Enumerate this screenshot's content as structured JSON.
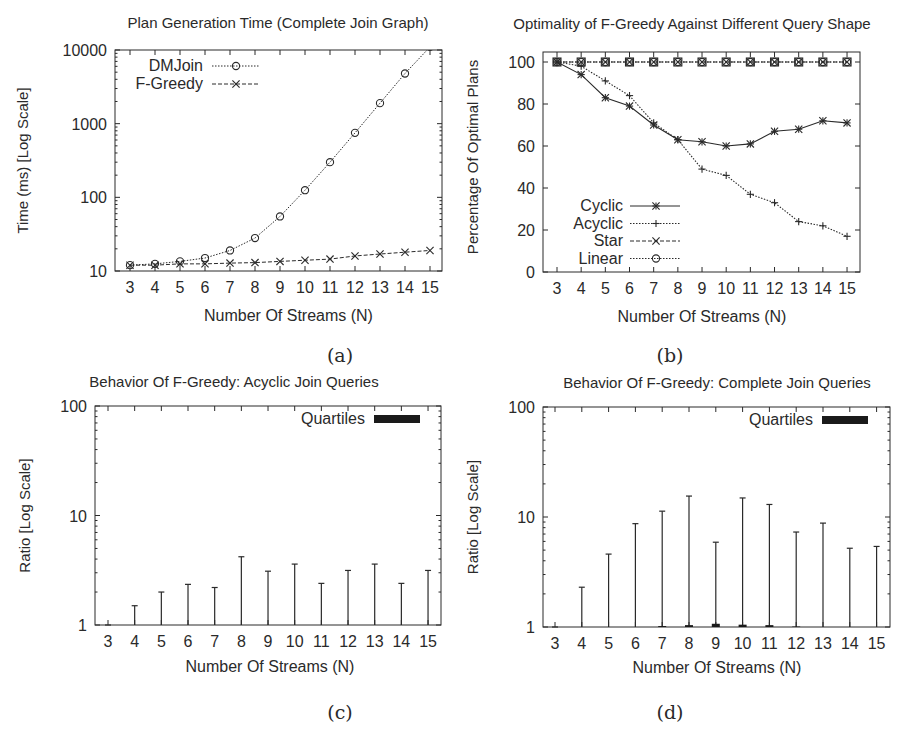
{
  "chart_data": [
    {
      "id": "a",
      "type": "line",
      "caption": "(a)",
      "title": "Plan Generation Time (Complete Join Graph)",
      "xlabel": "Number Of Streams (N)",
      "ylabel": "Time (ms) [Log Scale]",
      "yscale": "log",
      "ylim": [
        10,
        10000
      ],
      "yticks": [
        "10",
        "100",
        "1000",
        "10000"
      ],
      "x": [
        3,
        4,
        5,
        6,
        7,
        8,
        9,
        10,
        11,
        12,
        13,
        14,
        15
      ],
      "legend_position": "top-left",
      "grid": false,
      "series": [
        {
          "name": "DMJoin",
          "marker": "circle",
          "dash": "dotted",
          "values": [
            12,
            12.5,
            13.5,
            15,
            19,
            28,
            55,
            125,
            300,
            750,
            1900,
            4800,
            11000
          ]
        },
        {
          "name": "F-Greedy",
          "marker": "x",
          "dash": "dashed",
          "values": [
            12,
            12,
            12.5,
            12.5,
            12.8,
            13,
            13.5,
            14,
            14.5,
            16,
            17,
            18,
            19
          ]
        }
      ]
    },
    {
      "id": "b",
      "type": "line",
      "caption": "(b)",
      "title": "Optimality of F-Greedy Against Different Query Shape",
      "xlabel": "Number Of Streams (N)",
      "ylabel": "Percentage Of Optimal Plans",
      "ylim": [
        0,
        100
      ],
      "yticks": [
        "0",
        "20",
        "40",
        "60",
        "80",
        "100"
      ],
      "x": [
        3,
        4,
        5,
        6,
        7,
        8,
        9,
        10,
        11,
        12,
        13,
        14,
        15
      ],
      "legend_position": "bottom-left",
      "grid": false,
      "series": [
        {
          "name": "Cyclic",
          "marker": "asterisk",
          "dash": "solid",
          "values": [
            100,
            94,
            83,
            79,
            70,
            63,
            62,
            60,
            61,
            67,
            68,
            72,
            71
          ]
        },
        {
          "name": "Acyclic",
          "marker": "plus",
          "dash": "dotted",
          "values": [
            100,
            98,
            91,
            84,
            71,
            63,
            49,
            46,
            37,
            33,
            24,
            22,
            17
          ]
        },
        {
          "name": "Star",
          "marker": "x",
          "dash": "dashed",
          "values": [
            100,
            100,
            100,
            100,
            100,
            100,
            100,
            100,
            100,
            100,
            100,
            100,
            100
          ]
        },
        {
          "name": "Linear",
          "marker": "circle",
          "dash": "dotted",
          "values": [
            100,
            100,
            100,
            100,
            100,
            100,
            100,
            100,
            100,
            100,
            100,
            100,
            100
          ]
        }
      ]
    },
    {
      "id": "c",
      "type": "bar",
      "subtype": "candlestick-whisker",
      "caption": "(c)",
      "title": "Behavior Of F-Greedy: Acyclic Join Queries",
      "xlabel": "Number Of Streams (N)",
      "ylabel": "Ratio [Log Scale]",
      "yscale": "log",
      "ylim": [
        1,
        100
      ],
      "yticks": [
        "1",
        "10",
        "100"
      ],
      "categories": [
        "3",
        "4",
        "5",
        "6",
        "7",
        "8",
        "9",
        "10",
        "11",
        "12",
        "13",
        "14",
        "15"
      ],
      "legend": [
        "Quartiles"
      ],
      "legend_position": "top-right",
      "grid": false,
      "series": [
        {
          "name": "Max",
          "values": [
            1.0,
            1.5,
            2.0,
            2.35,
            2.2,
            4.2,
            3.1,
            3.6,
            2.4,
            3.15,
            3.6,
            2.4,
            3.15
          ]
        },
        {
          "name": "Quartiles (upper)",
          "values": [
            1,
            1,
            1,
            1,
            1,
            1,
            1,
            1,
            1,
            1,
            1,
            1,
            1
          ]
        }
      ]
    },
    {
      "id": "d",
      "type": "bar",
      "subtype": "candlestick-whisker",
      "caption": "(d)",
      "title": "Behavior Of F-Greedy: Complete Join Queries",
      "xlabel": "Number Of Streams (N)",
      "ylabel": "Ratio [Log Scale]",
      "yscale": "log",
      "ylim": [
        1,
        100
      ],
      "yticks": [
        "1",
        "10",
        "100"
      ],
      "categories": [
        "3",
        "4",
        "5",
        "6",
        "7",
        "8",
        "9",
        "10",
        "11",
        "12",
        "13",
        "14",
        "15"
      ],
      "legend": [
        "Quartiles"
      ],
      "legend_position": "top-right",
      "grid": false,
      "series": [
        {
          "name": "Max",
          "values": [
            1.0,
            2.3,
            4.6,
            8.7,
            11.3,
            15.5,
            5.9,
            14.9,
            13.0,
            7.3,
            8.8,
            5.2,
            5.4
          ]
        },
        {
          "name": "Quartiles (upper)",
          "values": [
            1,
            1,
            1,
            1,
            1.02,
            1.04,
            1.07,
            1.05,
            1.04,
            1.01,
            1,
            1,
            1
          ]
        }
      ]
    }
  ]
}
